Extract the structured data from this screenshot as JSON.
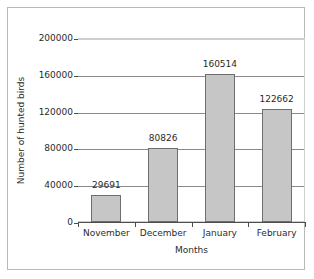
{
  "chart_data": {
    "type": "bar",
    "title": "",
    "subtitle": "",
    "categories": [
      "November",
      "December",
      "January",
      "February"
    ],
    "values": [
      29691,
      80826,
      160514,
      122662
    ],
    "data_labels": [
      "29691",
      "80826",
      "160514",
      "122662"
    ],
    "xlabel": "Months",
    "ylabel": "Number of hunted birds",
    "ylim": [
      0,
      200000
    ],
    "ytick_values": [
      0,
      40000,
      80000,
      120000,
      160000,
      200000
    ],
    "ytick_labels": [
      "0",
      "40000",
      "80000",
      "120000",
      "160000",
      "200000"
    ],
    "grid": "horizontal",
    "legend": "none",
    "bar_color": "#c6c6c6",
    "bar_border_color": "#6e6e6e",
    "axis_color": "#4d4d4d",
    "gridline_color": "#8a8a8a",
    "frame_color": "#b9b9b9",
    "background_color": "#ffffff"
  }
}
